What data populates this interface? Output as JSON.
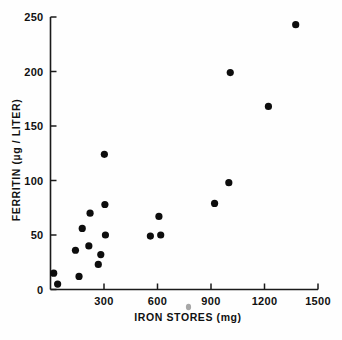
{
  "chart_data": {
    "type": "scatter",
    "title": "",
    "xlabel": "IRON STORES (mg)",
    "ylabel": "FERRITIN (µg / LITER)",
    "xlim": [
      0,
      1500
    ],
    "ylim": [
      0,
      250
    ],
    "grid": false,
    "legend": null,
    "xticks": [
      300,
      600,
      900,
      1200,
      1500
    ],
    "xtick_labels": [
      "300",
      "600",
      "900",
      "1200",
      "1500"
    ],
    "yticks": [
      0,
      50,
      100,
      150,
      200,
      250
    ],
    "ytick_labels": [
      "0",
      "50",
      "100",
      "150",
      "200",
      "250"
    ],
    "marker": "filled-circle",
    "marker_color": "#0d0d0d",
    "points": [
      {
        "x": 18,
        "y": 15
      },
      {
        "x": 40,
        "y": 5
      },
      {
        "x": 140,
        "y": 36
      },
      {
        "x": 160,
        "y": 12
      },
      {
        "x": 178,
        "y": 56
      },
      {
        "x": 215,
        "y": 40
      },
      {
        "x": 222,
        "y": 70
      },
      {
        "x": 268,
        "y": 23
      },
      {
        "x": 282,
        "y": 32
      },
      {
        "x": 302,
        "y": 124
      },
      {
        "x": 305,
        "y": 78
      },
      {
        "x": 308,
        "y": 50
      },
      {
        "x": 560,
        "y": 49
      },
      {
        "x": 608,
        "y": 67
      },
      {
        "x": 618,
        "y": 50
      },
      {
        "x": 920,
        "y": 79
      },
      {
        "x": 1000,
        "y": 98
      },
      {
        "x": 1008,
        "y": 199
      },
      {
        "x": 1222,
        "y": 168
      },
      {
        "x": 1375,
        "y": 243
      }
    ],
    "series": [
      {
        "name": "ferritin vs iron stores",
        "x": [
          18,
          40,
          140,
          160,
          178,
          215,
          222,
          268,
          282,
          302,
          305,
          308,
          560,
          608,
          618,
          920,
          1000,
          1008,
          1222,
          1375
        ],
        "values": [
          15,
          5,
          36,
          12,
          56,
          40,
          70,
          23,
          32,
          124,
          78,
          50,
          49,
          67,
          50,
          79,
          98,
          199,
          168,
          243
        ]
      }
    ]
  },
  "axes": {
    "x_title": "IRON STORES (mg)",
    "y_title": "FERRITIN (µg / LITER)"
  },
  "colors": {
    "marker": "#0d0d0d",
    "axis": "#1a1a1a",
    "background": "#fefefe"
  }
}
